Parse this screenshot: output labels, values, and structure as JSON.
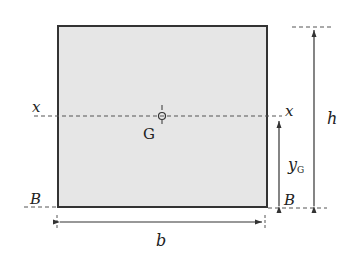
{
  "diagram": {
    "type": "rectangular cross-section",
    "colors": {
      "fill": "#e6e6e6",
      "stroke": "#333333",
      "line": "#444444"
    },
    "labels": {
      "x_left": "x",
      "x_right": "x",
      "centroid": "G",
      "height": "h",
      "centroid_distance": "y",
      "centroid_distance_sub": "G",
      "base_left": "B",
      "base_right": "B",
      "width": "b"
    }
  }
}
